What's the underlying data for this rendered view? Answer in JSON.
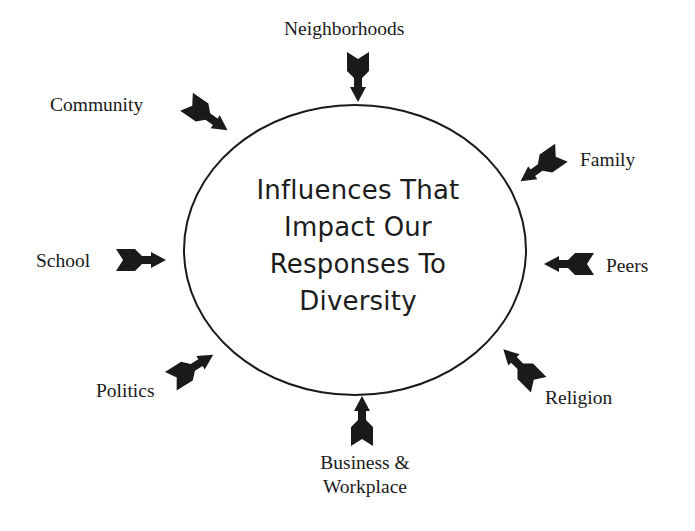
{
  "diagram": {
    "center": {
      "lines": [
        "Influences That",
        "Impact Our",
        "Responses To",
        "Diversity"
      ]
    },
    "influences": [
      {
        "label": "Neighborhoods",
        "arrow": {
          "x": 358,
          "y": 77,
          "angle": 90
        }
      },
      {
        "label": "Community",
        "arrow": {
          "x": 207,
          "y": 116,
          "angle": 35
        }
      },
      {
        "label": "Family",
        "arrow": {
          "x": 541,
          "y": 167,
          "angle": 145
        }
      },
      {
        "label": "School",
        "arrow": {
          "x": 141,
          "y": 260,
          "angle": 0
        }
      },
      {
        "label": "Peers",
        "arrow": {
          "x": 569,
          "y": 264,
          "angle": 180
        }
      },
      {
        "label": "Politics",
        "arrow": {
          "x": 192,
          "y": 368,
          "angle": -32
        }
      },
      {
        "label": "Religion",
        "arrow": {
          "x": 521,
          "y": 367,
          "angle": -135
        }
      },
      {
        "label_lines": [
          "Business &",
          "Workplace"
        ],
        "arrow": {
          "x": 362,
          "y": 421,
          "angle": -90
        }
      }
    ],
    "colors": {
      "ink": "#1a1a1a",
      "background": "#ffffff"
    }
  }
}
